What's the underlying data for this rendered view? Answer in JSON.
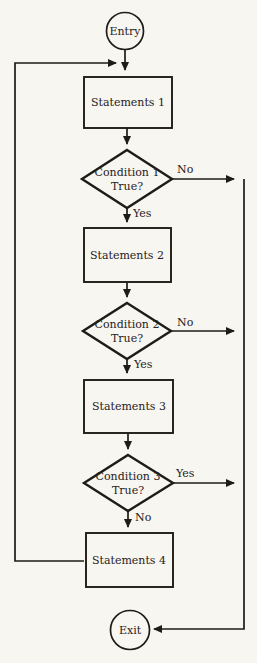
{
  "colors": {
    "background": "#f8f6f1",
    "line": "#1f1c18",
    "text": "#26211b"
  },
  "flow": {
    "entry_label": "Entry",
    "exit_label": "Exit",
    "boxes": [
      {
        "label": "Statements 1"
      },
      {
        "label": "Statements 2"
      },
      {
        "label": "Statements 3"
      },
      {
        "label": "Statements 4"
      }
    ],
    "decisions": [
      {
        "name": "Condition 1",
        "question": "True?",
        "side_branch": "No",
        "down_branch": "Yes"
      },
      {
        "name": "Condition 2",
        "question": "True?",
        "side_branch": "No",
        "down_branch": "Yes"
      },
      {
        "name": "Condition 3",
        "question": "True?",
        "side_branch": "Yes",
        "down_branch": "No"
      }
    ]
  }
}
